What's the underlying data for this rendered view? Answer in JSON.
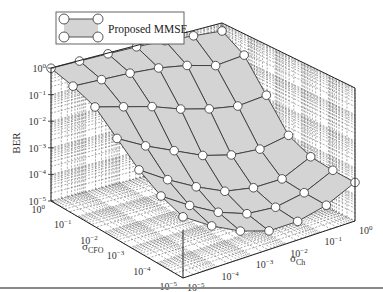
{
  "chart_data": {
    "type": "surface3d",
    "title": "",
    "legend": [
      {
        "label": "Proposed MMSE",
        "marker": "open-circle",
        "line": "solid",
        "fill": "#d4d4d4"
      }
    ],
    "zlabel": "BER",
    "xlabel": "σ_CFO",
    "ylabel": "σ_Ch",
    "xlabel_main": "σ",
    "xlabel_sub": "CFO",
    "ylabel_main": "σ",
    "ylabel_sub": "Ch",
    "zscale": "log",
    "xscale": "log",
    "yscale": "log",
    "zlim": [
      1e-05,
      1
    ],
    "xlim": [
      1e-05,
      1
    ],
    "ylim": [
      1e-05,
      1
    ],
    "z_ticks": [
      {
        "label_base": "10",
        "label_exp": "0",
        "value": 0
      },
      {
        "label_base": "10",
        "label_exp": "−1",
        "value": -1
      },
      {
        "label_base": "10",
        "label_exp": "−2",
        "value": -2
      },
      {
        "label_base": "10",
        "label_exp": "−3",
        "value": -3
      },
      {
        "label_base": "10",
        "label_exp": "−4",
        "value": -4
      },
      {
        "label_base": "10",
        "label_exp": "−5",
        "value": -5
      }
    ],
    "x_ticks": [
      {
        "label_base": "10",
        "label_exp": "0",
        "value": 0
      },
      {
        "label_base": "10",
        "label_exp": "−1",
        "value": -1
      },
      {
        "label_base": "10",
        "label_exp": "−2",
        "value": -2
      },
      {
        "label_base": "10",
        "label_exp": "−3",
        "value": -3
      },
      {
        "label_base": "10",
        "label_exp": "−4",
        "value": -4
      },
      {
        "label_base": "10",
        "label_exp": "−5",
        "value": -5
      }
    ],
    "y_ticks": [
      {
        "label_base": "10",
        "label_exp": "0",
        "value": 0
      },
      {
        "label_base": "10",
        "label_exp": "−1",
        "value": -1
      },
      {
        "label_base": "10",
        "label_exp": "−2",
        "value": -2
      },
      {
        "label_base": "10",
        "label_exp": "−3",
        "value": -3
      },
      {
        "label_base": "10",
        "label_exp": "−4",
        "value": -4
      },
      {
        "label_base": "10",
        "label_exp": "−5",
        "value": -5
      }
    ],
    "grid": true,
    "legend_position": "top-left",
    "x_log_values": [
      0,
      -0.8333,
      -1.6667,
      -2.5,
      -3.3333,
      -4.1667,
      -5
    ],
    "y_log_values": [
      0,
      -0.8333,
      -1.6667,
      -2.5,
      -3.3333,
      -4.1667,
      -5
    ],
    "z_log_values": [
      [
        -0.3,
        -0.2,
        -0.1,
        -0.05,
        -0.03,
        -0.02,
        -0.01
      ],
      [
        -0.8,
        -0.9,
        -0.6,
        -0.4,
        -0.3,
        -0.25,
        -0.2
      ],
      [
        -1.9,
        -2.0,
        -1.8,
        -1.5,
        -1.1,
        -0.8,
        -0.5
      ],
      [
        -3.0,
        -3.2,
        -3.1,
        -2.8,
        -2.3,
        -1.8,
        -1.2
      ],
      [
        -3.4,
        -3.9,
        -3.9,
        -3.7,
        -3.2,
        -2.6,
        -1.9
      ],
      [
        -3.5,
        -4.0,
        -4.2,
        -4.1,
        -3.7,
        -3.1,
        -2.4
      ],
      [
        -3.55,
        -4.05,
        -4.3,
        -4.3,
        -3.95,
        -3.4,
        -2.7
      ]
    ]
  }
}
